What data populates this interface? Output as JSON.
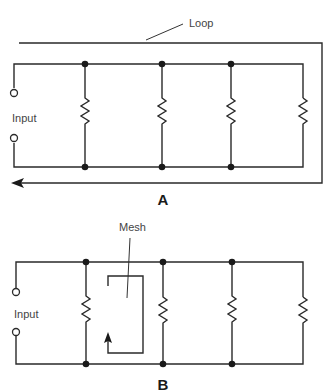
{
  "figure": {
    "panels": [
      {
        "id": "A",
        "caption": "A",
        "input_label": "Input",
        "annotation": "Loop",
        "resistor_count": 4,
        "junction_nodes": 6
      },
      {
        "id": "B",
        "caption": "B",
        "input_label": "Input",
        "annotation": "Mesh",
        "resistor_count": 4,
        "junction_nodes": 6
      }
    ]
  }
}
